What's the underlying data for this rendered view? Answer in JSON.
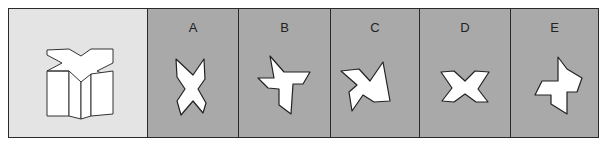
{
  "puzzle": {
    "question": {
      "shape": "3d-x-prism-icon",
      "description": "Right prism with X-shaped cross-section viewed from above-front"
    },
    "options": [
      {
        "label": "A",
        "shape": "x-shape-vertical-icon"
      },
      {
        "label": "B",
        "shape": "pinwheel-cross-icon"
      },
      {
        "label": "C",
        "shape": "skewed-x-icon"
      },
      {
        "label": "D",
        "shape": "x-shape-horizontal-icon"
      },
      {
        "label": "E",
        "shape": "pinwheel-cross-small-icon"
      }
    ]
  },
  "colors": {
    "question_bg": "#e4e4e4",
    "option_bg": "#a9a9a9",
    "border": "#2a2a2a",
    "shape_fill": "#ffffff",
    "shape_stroke": "#222222"
  }
}
